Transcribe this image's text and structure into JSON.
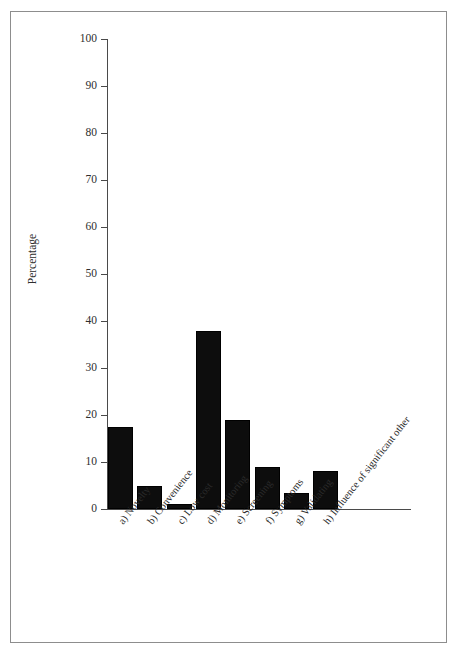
{
  "chart_data": {
    "type": "bar",
    "title": "",
    "xlabel": "",
    "ylabel": "Percentage",
    "ylim": [
      0,
      100
    ],
    "yticks": [
      0,
      10,
      20,
      30,
      40,
      50,
      60,
      70,
      80,
      90,
      100
    ],
    "ytick_labels": [
      "0",
      "10",
      "20",
      "30",
      "40",
      "50",
      "60",
      "70",
      "80",
      "90",
      "100"
    ],
    "grid": false,
    "legend": null,
    "bar_color": "#0d0d0d",
    "categories": [
      "a) Novelty",
      "b) Convenience",
      "c) Low cost",
      "d) Monitoring",
      "e) Screening",
      "f) Symptoms",
      "g) Validating",
      "h) Influence of significant other"
    ],
    "values": [
      17.5,
      5,
      1,
      37.8,
      19,
      9,
      3.5,
      8
    ]
  }
}
